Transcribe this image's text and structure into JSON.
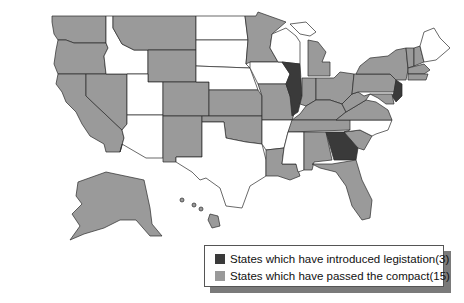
{
  "colors": {
    "introduced": "#3a3a3a",
    "passed": "#9a9a9a",
    "none": "#ffffff",
    "border": "#2a2a2a"
  },
  "legend": {
    "items": [
      {
        "label": "States which have introduced legistation",
        "count": "(3)",
        "category": "introduced"
      },
      {
        "label": "States which have passed the compact",
        "count": "(15)",
        "category": "passed"
      }
    ]
  },
  "map": {
    "states_introduced": [
      "Illinois",
      "Georgia",
      "New Jersey"
    ],
    "states_passed": [
      "Washington",
      "Oregon",
      "California",
      "Nevada",
      "Montana",
      "Wyoming",
      "Colorado",
      "New Mexico",
      "Arizona",
      "Kansas",
      "Oklahoma",
      "Minnesota",
      "Missouri",
      "Louisiana",
      "Michigan",
      "Indiana",
      "Ohio",
      "Kentucky",
      "Tennessee",
      "West Virginia",
      "Virginia",
      "Pennsylvania",
      "New York",
      "Vermont",
      "New Hampshire",
      "Massachusetts",
      "Connecticut",
      "Rhode Island",
      "Maryland",
      "Delaware",
      "Alabama",
      "South Carolina",
      "Florida",
      "Alaska",
      "Hawaii"
    ],
    "states_none": [
      "Idaho",
      "Utah",
      "North Dakota",
      "South Dakota",
      "Nebraska",
      "Iowa",
      "Wisconsin",
      "Texas",
      "Arkansas",
      "Mississippi",
      "North Carolina",
      "Maine"
    ]
  }
}
